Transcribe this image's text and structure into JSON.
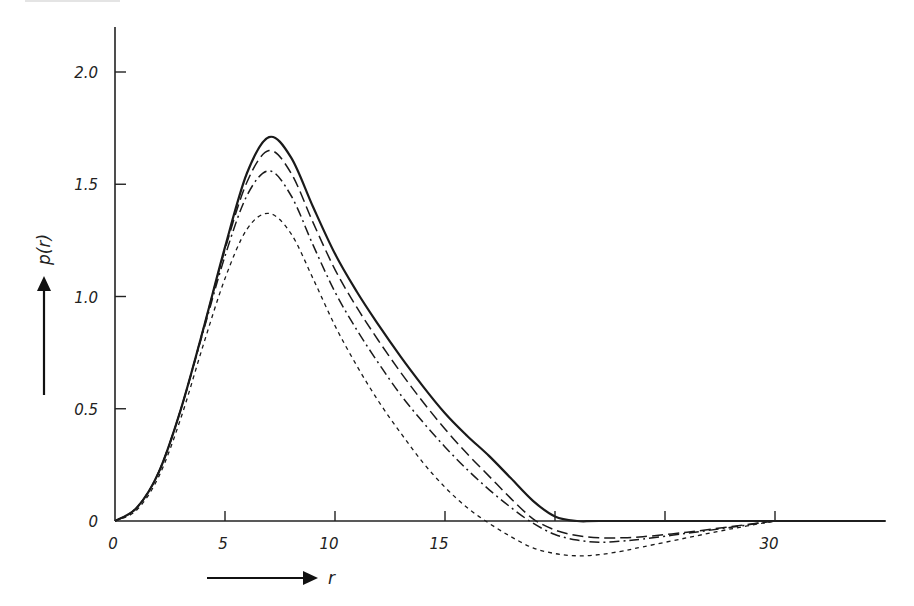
{
  "chart_data": {
    "type": "line",
    "title": "",
    "xlabel": "r",
    "ylabel": "p(r)",
    "xlim": [
      0,
      35
    ],
    "ylim": [
      -0.2,
      2.2
    ],
    "x_ticks": [
      0,
      5,
      10,
      15,
      20,
      25,
      30
    ],
    "x_tick_labels": [
      "0",
      "5",
      "10",
      "15",
      "",
      "",
      "30"
    ],
    "y_ticks": [
      0,
      0.5,
      1.0,
      1.5,
      2.0
    ],
    "y_tick_labels": [
      "0",
      "0.5",
      "1.0",
      "1.5",
      "2.0"
    ],
    "grid": false,
    "legend": null,
    "series": [
      {
        "name": "solid",
        "style": "solid",
        "x": [
          0,
          1,
          2,
          3,
          4,
          5,
          6,
          7,
          8,
          9,
          10,
          11,
          12,
          13,
          14,
          15,
          16,
          17,
          18,
          19,
          20,
          21,
          22,
          25,
          30,
          35
        ],
        "y": [
          0,
          0.06,
          0.22,
          0.5,
          0.85,
          1.22,
          1.55,
          1.71,
          1.62,
          1.4,
          1.19,
          1.02,
          0.87,
          0.73,
          0.6,
          0.48,
          0.38,
          0.29,
          0.19,
          0.09,
          0.02,
          0.0,
          0.0,
          0.0,
          0.0,
          0.0
        ]
      },
      {
        "name": "long-dashed",
        "style": "dashed",
        "x": [
          0,
          1,
          2,
          3,
          4,
          5,
          6,
          7,
          8,
          9,
          10,
          11,
          12,
          13,
          14,
          15,
          16,
          17,
          18,
          19,
          20,
          21,
          22,
          23,
          24,
          26,
          28,
          30
        ],
        "y": [
          0,
          0.06,
          0.22,
          0.5,
          0.85,
          1.21,
          1.51,
          1.65,
          1.55,
          1.33,
          1.12,
          0.95,
          0.8,
          0.66,
          0.53,
          0.41,
          0.3,
          0.2,
          0.1,
          0.01,
          -0.04,
          -0.065,
          -0.075,
          -0.075,
          -0.07,
          -0.05,
          -0.025,
          0.0
        ]
      },
      {
        "name": "dash-dot",
        "style": "dashdot",
        "x": [
          0,
          1,
          2,
          3,
          4,
          5,
          6,
          7,
          8,
          9,
          10,
          11,
          12,
          13,
          14,
          15,
          16,
          17,
          18,
          19,
          20,
          21,
          22,
          23,
          24,
          26,
          28,
          30
        ],
        "y": [
          0,
          0.06,
          0.22,
          0.5,
          0.84,
          1.18,
          1.45,
          1.56,
          1.45,
          1.23,
          1.02,
          0.85,
          0.7,
          0.56,
          0.44,
          0.33,
          0.23,
          0.14,
          0.06,
          -0.01,
          -0.06,
          -0.085,
          -0.095,
          -0.09,
          -0.08,
          -0.055,
          -0.028,
          0.0
        ]
      },
      {
        "name": "short-dashed",
        "style": "dotted",
        "x": [
          0,
          1,
          2,
          3,
          4,
          5,
          6,
          7,
          8,
          9,
          10,
          11,
          12,
          13,
          14,
          15,
          16,
          17,
          18,
          19,
          20,
          21,
          22,
          23,
          24,
          26,
          28,
          30
        ],
        "y": [
          0,
          0.05,
          0.2,
          0.46,
          0.78,
          1.08,
          1.3,
          1.37,
          1.28,
          1.08,
          0.87,
          0.69,
          0.53,
          0.39,
          0.26,
          0.15,
          0.06,
          -0.01,
          -0.07,
          -0.12,
          -0.145,
          -0.155,
          -0.15,
          -0.135,
          -0.115,
          -0.075,
          -0.035,
          0.0
        ]
      }
    ]
  },
  "axis": {
    "x_title": "r",
    "y_title": "p(r)"
  }
}
